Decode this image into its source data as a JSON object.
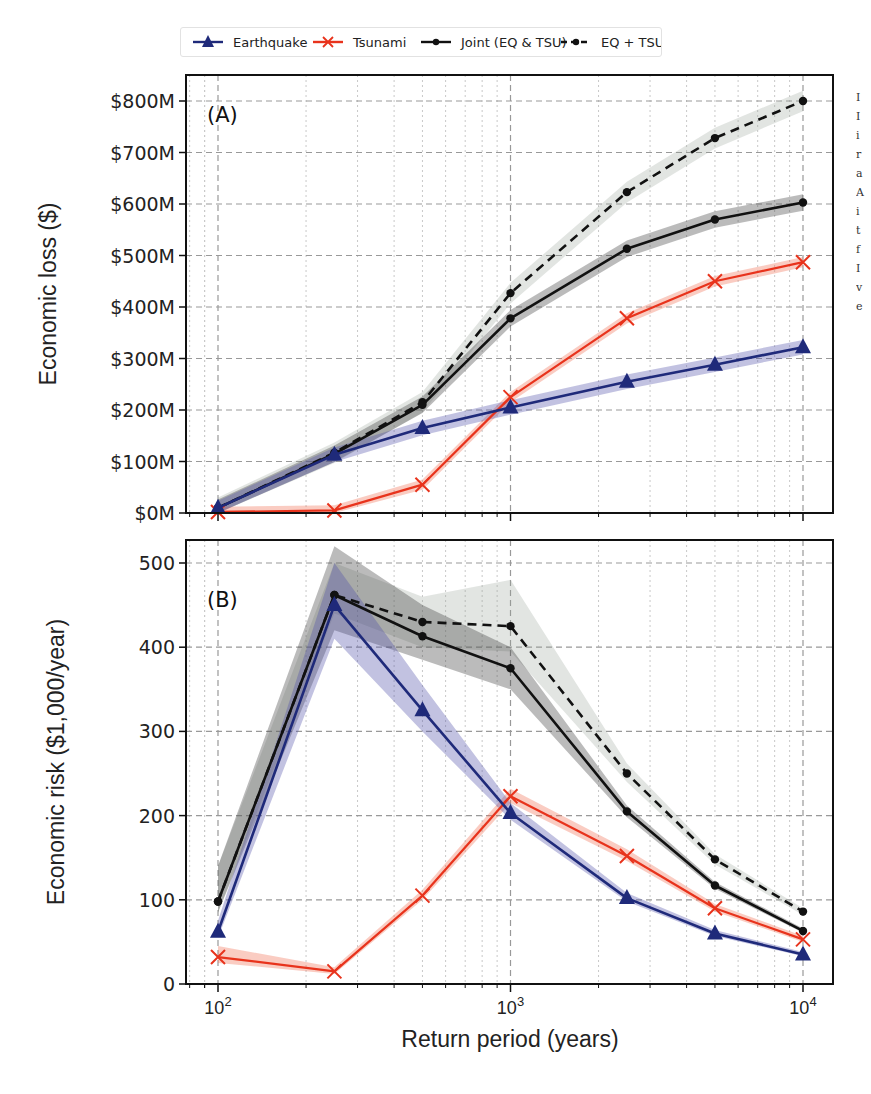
{
  "legend": {
    "items": [
      {
        "label": "Earthquake",
        "color": "#1f2a7a",
        "marker": "triangle",
        "dash": "solid"
      },
      {
        "label": "Tsunami",
        "color": "#e8331c",
        "marker": "x",
        "dash": "solid"
      },
      {
        "label": "Joint (EQ & TSU)",
        "color": "#111111",
        "marker": "dot",
        "dash": "solid"
      },
      {
        "label": "EQ + TSU",
        "color": "#111111",
        "marker": "dot",
        "dash": "dashed"
      }
    ]
  },
  "caption_fragments": [
    "I",
    "I",
    "i",
    "r",
    "a",
    "A",
    "i",
    "t",
    "f",
    "I",
    "v",
    "e"
  ],
  "chart_data": [
    {
      "type": "line",
      "panel_label": "(A)",
      "title": "",
      "xlabel": "",
      "ylabel": "Economic loss ($)",
      "xscale": "log",
      "x": [
        100,
        250,
        500,
        1000,
        2500,
        5000,
        10000
      ],
      "x_ticks": [
        "10^2",
        "10^3",
        "10^4"
      ],
      "y_ticks": [
        "$0M",
        "$100M",
        "$200M",
        "$300M",
        "$400M",
        "$500M",
        "$600M",
        "$700M",
        "$800M"
      ],
      "ylim": [
        0,
        830
      ],
      "grid": true,
      "series": [
        {
          "name": "Earthquake",
          "values": [
            10,
            113,
            165,
            205,
            255,
            288,
            322
          ],
          "band": 14
        },
        {
          "name": "Tsunami",
          "values": [
            2,
            5,
            55,
            225,
            378,
            450,
            487
          ],
          "band": 10
        },
        {
          "name": "Joint (EQ & TSU)",
          "values": [
            10,
            115,
            210,
            378,
            513,
            570,
            603
          ],
          "band": 16
        },
        {
          "name": "EQ + TSU",
          "values": [
            10,
            117,
            215,
            427,
            623,
            728,
            800
          ],
          "band": 20
        }
      ],
      "units": "million USD"
    },
    {
      "type": "line",
      "panel_label": "(B)",
      "title": "",
      "xlabel": "Return period (years)",
      "ylabel": "Economic risk ($1,000/year)",
      "xscale": "log",
      "x": [
        100,
        250,
        500,
        1000,
        2500,
        5000,
        10000
      ],
      "x_ticks": [
        "10^2",
        "10^3",
        "10^4"
      ],
      "y_ticks": [
        "0",
        "100",
        "200",
        "300",
        "400",
        "500"
      ],
      "ylim": [
        0,
        525
      ],
      "grid": true,
      "series": [
        {
          "name": "Earthquake",
          "values": [
            62,
            450,
            325,
            203,
            102,
            60,
            35
          ],
          "band_lo": [
            55,
            410,
            300,
            195,
            98,
            57,
            33
          ],
          "band_hi": [
            75,
            500,
            355,
            215,
            108,
            64,
            38
          ]
        },
        {
          "name": "Tsunami",
          "values": [
            32,
            15,
            105,
            223,
            152,
            90,
            53
          ],
          "band_lo": [
            25,
            12,
            100,
            215,
            146,
            86,
            50
          ],
          "band_hi": [
            45,
            20,
            112,
            232,
            160,
            95,
            57
          ]
        },
        {
          "name": "Joint (EQ & TSU)",
          "values": [
            98,
            462,
            413,
            375,
            205,
            117,
            63
          ],
          "band_lo": [
            85,
            420,
            385,
            350,
            198,
            113,
            61
          ],
          "band_hi": [
            140,
            520,
            450,
            400,
            212,
            121,
            66
          ]
        },
        {
          "name": "EQ + TSU",
          "values": [
            98,
            462,
            430,
            425,
            250,
            148,
            86
          ],
          "band_lo": [
            85,
            440,
            400,
            395,
            240,
            142,
            82
          ],
          "band_hi": [
            140,
            500,
            460,
            480,
            262,
            154,
            90
          ]
        }
      ]
    }
  ]
}
